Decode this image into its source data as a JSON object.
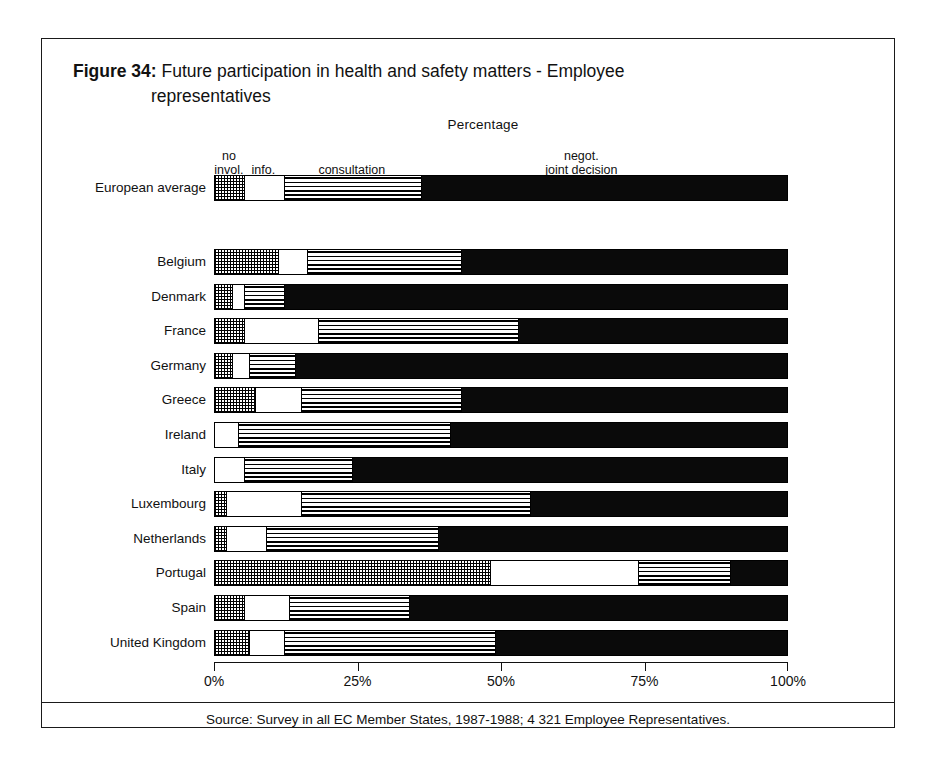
{
  "figure": {
    "number": "Figure 34:",
    "title_line1": "Future participation in health and safety matters - Employee",
    "title_line2": "representatives",
    "axis_caption": "Percentage",
    "source": "Source: Survey in all EC Member States, 1987-1988; 4 321 Employee Representatives."
  },
  "legend": {
    "no_invol": "no\ninvol.",
    "info": "info.",
    "consultation": "consultation",
    "negot": "negot.\njoint decision"
  },
  "axis": {
    "ticks": [
      "0%",
      "25%",
      "50%",
      "75%",
      "100%"
    ],
    "tick_values": [
      0,
      25,
      50,
      75,
      100
    ],
    "min": 0,
    "max": 100
  },
  "chart_data": {
    "type": "bar",
    "orientation": "horizontal",
    "stacked": true,
    "title": "Figure 34: Future participation in health and safety matters - Employee representatives",
    "xlabel": "Percentage",
    "ylabel": "",
    "xlim": [
      0,
      100
    ],
    "grid": false,
    "legend_position": "top",
    "series": [
      {
        "name": "no invol.",
        "pattern": "checkered",
        "values": [
          5,
          11,
          3,
          5,
          3,
          7,
          0,
          0,
          2,
          2,
          48,
          5,
          6
        ]
      },
      {
        "name": "info.",
        "pattern": "white",
        "values": [
          7,
          5,
          2,
          13,
          3,
          8,
          4,
          5,
          13,
          7,
          26,
          8,
          6
        ]
      },
      {
        "name": "consultation",
        "pattern": "horizontal-stripes",
        "values": [
          24,
          27,
          7,
          35,
          8,
          28,
          37,
          19,
          40,
          30,
          16,
          21,
          37
        ]
      },
      {
        "name": "negot. joint decision",
        "pattern": "solid-black",
        "values": [
          64,
          57,
          88,
          47,
          86,
          57,
          59,
          76,
          45,
          61,
          10,
          66,
          51
        ]
      }
    ],
    "categories": [
      "European average",
      "Belgium",
      "Denmark",
      "France",
      "Germany",
      "Greece",
      "Ireland",
      "Italy",
      "Luxembourg",
      "Netherlands",
      "Portugal",
      "Spain",
      "United Kingdom"
    ]
  },
  "rows": [
    {
      "label": "European average",
      "group": "average",
      "segments": [
        5,
        7,
        24,
        64
      ]
    },
    {
      "label": "Belgium",
      "group": "country",
      "segments": [
        11,
        5,
        27,
        57
      ]
    },
    {
      "label": "Denmark",
      "group": "country",
      "segments": [
        3,
        2,
        7,
        88
      ]
    },
    {
      "label": "France",
      "group": "country",
      "segments": [
        5,
        13,
        35,
        47
      ]
    },
    {
      "label": "Germany",
      "group": "country",
      "segments": [
        3,
        3,
        8,
        86
      ]
    },
    {
      "label": "Greece",
      "group": "country",
      "segments": [
        7,
        8,
        28,
        57
      ]
    },
    {
      "label": "Ireland",
      "group": "country",
      "segments": [
        0,
        4,
        37,
        59
      ]
    },
    {
      "label": "Italy",
      "group": "country",
      "segments": [
        0,
        5,
        19,
        76
      ]
    },
    {
      "label": "Luxembourg",
      "group": "country",
      "segments": [
        2,
        13,
        40,
        45
      ]
    },
    {
      "label": "Netherlands",
      "group": "country",
      "segments": [
        2,
        7,
        30,
        61
      ]
    },
    {
      "label": "Portugal",
      "group": "country",
      "segments": [
        48,
        26,
        16,
        10
      ]
    },
    {
      "label": "Spain",
      "group": "country",
      "segments": [
        5,
        8,
        21,
        66
      ]
    },
    {
      "label": "United Kingdom",
      "group": "country",
      "segments": [
        6,
        6,
        37,
        51
      ]
    }
  ]
}
